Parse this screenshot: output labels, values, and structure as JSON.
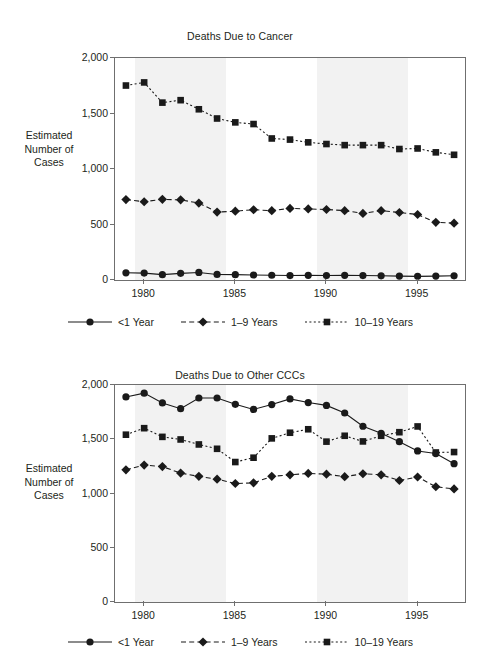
{
  "figures": [
    {
      "id": "cancer",
      "title": "Deaths Due to Cancer",
      "axis_label": "Estimated\nNumber of\nCases"
    },
    {
      "id": "otherccc",
      "title": "Deaths Due to Other CCCs",
      "axis_label": "Estimated\nNumber of\nCases"
    }
  ],
  "axis_label_lines": {
    "line1": "Estimated",
    "line2": "Number of",
    "line3": "Cases"
  },
  "legend": {
    "items": [
      {
        "label": "<1 Year",
        "marker": "circle",
        "line": "solid",
        "color": "#1a1a1a"
      },
      {
        "label": "1–9 Years",
        "marker": "diamond",
        "line": "dashed",
        "color": "#1a1a1a"
      },
      {
        "label": "10–19 Years",
        "marker": "square",
        "line": "dotted",
        "color": "#1a1a1a"
      }
    ]
  },
  "chart_data": [
    {
      "type": "line",
      "title": "Deaths Due to Cancer",
      "xlabel": "",
      "ylabel": "Estimated Number of Cases",
      "ylim": [
        0,
        2000
      ],
      "yticks": [
        0,
        500,
        1000,
        1500,
        2000
      ],
      "ytick_labels": [
        "0",
        "500",
        "1,000",
        "1,500",
        "2,000"
      ],
      "xlim": [
        1978.4,
        1997.6
      ],
      "xticks": [
        1980,
        1985,
        1990,
        1995
      ],
      "xtick_labels": [
        "1980",
        "1985",
        "1990",
        "1995"
      ],
      "grid": false,
      "legend_position": "bottom",
      "shaded_bands": [
        [
          1979.5,
          1984.5
        ],
        [
          1989.5,
          1994.5
        ]
      ],
      "x": [
        1979,
        1980,
        1981,
        1982,
        1983,
        1984,
        1985,
        1986,
        1987,
        1988,
        1989,
        1990,
        1991,
        1992,
        1993,
        1994,
        1995,
        1996,
        1997
      ],
      "series": [
        {
          "name": "<1 Year",
          "marker": "circle",
          "line": "solid",
          "values": [
            65,
            62,
            48,
            60,
            68,
            50,
            48,
            45,
            43,
            40,
            42,
            40,
            42,
            40,
            38,
            35,
            33,
            35,
            38
          ]
        },
        {
          "name": "1–9 Years",
          "marker": "diamond",
          "line": "dashed",
          "values": [
            725,
            705,
            727,
            722,
            693,
            612,
            620,
            633,
            625,
            645,
            640,
            635,
            625,
            600,
            625,
            608,
            590,
            520,
            512
          ]
        },
        {
          "name": "10–19 Years",
          "marker": "square",
          "line": "dotted",
          "values": [
            1752,
            1780,
            1598,
            1620,
            1538,
            1455,
            1420,
            1405,
            1275,
            1265,
            1240,
            1225,
            1215,
            1215,
            1215,
            1180,
            1185,
            1150,
            1128
          ]
        }
      ]
    },
    {
      "type": "line",
      "title": "Deaths Due to Other CCCs",
      "xlabel": "",
      "ylabel": "Estimated Number of Cases",
      "ylim": [
        0,
        2000
      ],
      "yticks": [
        0,
        500,
        1000,
        1500,
        2000
      ],
      "ytick_labels": [
        "0",
        "500",
        "1,000",
        "1,500",
        "2,000"
      ],
      "xlim": [
        1978.4,
        1997.6
      ],
      "xticks": [
        1980,
        1985,
        1990,
        1995
      ],
      "xtick_labels": [
        "1980",
        "1985",
        "1990",
        "1995"
      ],
      "grid": false,
      "legend_position": "bottom",
      "shaded_bands": [
        [
          1979.5,
          1984.5
        ],
        [
          1989.5,
          1994.5
        ]
      ],
      "x": [
        1979,
        1980,
        1981,
        1982,
        1983,
        1984,
        1985,
        1986,
        1987,
        1988,
        1989,
        1990,
        1991,
        1992,
        1993,
        1994,
        1995,
        1996,
        1997
      ],
      "series": [
        {
          "name": "<1 Year",
          "marker": "circle",
          "line": "solid",
          "values": [
            1890,
            1925,
            1835,
            1782,
            1880,
            1880,
            1822,
            1775,
            1820,
            1872,
            1838,
            1812,
            1742,
            1620,
            1555,
            1478,
            1392,
            1368,
            1275
          ]
        },
        {
          "name": "1–9 Years",
          "marker": "diamond",
          "line": "dashed",
          "values": [
            1218,
            1262,
            1248,
            1188,
            1158,
            1132,
            1092,
            1098,
            1158,
            1172,
            1185,
            1178,
            1155,
            1182,
            1172,
            1120,
            1152,
            1062,
            1042,
            975,
            850
          ]
        },
        {
          "name": "10–19 Years",
          "marker": "square",
          "line": "dotted",
          "values": [
            1542,
            1602,
            1522,
            1498,
            1452,
            1412,
            1290,
            1330,
            1508,
            1560,
            1592,
            1478,
            1532,
            1480,
            1532,
            1565,
            1618,
            1378,
            1382
          ]
        }
      ]
    }
  ]
}
